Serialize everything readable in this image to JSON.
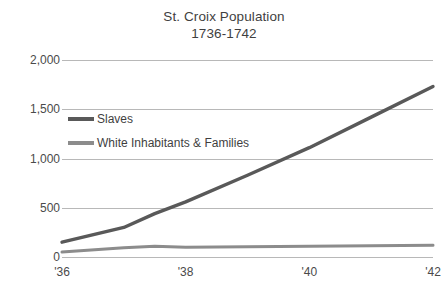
{
  "chart_data": {
    "type": "line",
    "title": "St. Croix Population",
    "subtitle": "1736-1742",
    "xlabel": "",
    "ylabel": "",
    "grid": true,
    "legend_position": "inline-plot",
    "x": [
      1736,
      1737,
      1737.5,
      1738,
      1739,
      1740,
      1741,
      1742
    ],
    "xtick_labels": [
      "'36",
      "'38",
      "'40",
      "'42"
    ],
    "xtick_values": [
      1736,
      1738,
      1740,
      1742
    ],
    "xlim": [
      1736,
      1742
    ],
    "ytick_labels": [
      "0",
      "500",
      "1,000",
      "1,500",
      "2,000"
    ],
    "ytick_values": [
      0,
      500,
      1000,
      1500,
      2000
    ],
    "ylim": [
      0,
      2000
    ],
    "series": [
      {
        "name": "Slaves",
        "color": "#595959",
        "values": [
          150,
          300,
          440,
          560,
          830,
          1110,
          1420,
          1730
        ]
      },
      {
        "name": "White Inhabitants & Families",
        "color": "#8c8c8c",
        "values": [
          50,
          95,
          110,
          100,
          105,
          110,
          115,
          120
        ]
      }
    ]
  },
  "title": {
    "line1": "St. Croix Population",
    "line2": "1736-1742"
  },
  "axes": {
    "y_ticks": [
      {
        "label": "2,000",
        "value": 2000
      },
      {
        "label": "1,500",
        "value": 1500
      },
      {
        "label": "1,000",
        "value": 1000
      },
      {
        "label": "500",
        "value": 500
      },
      {
        "label": "0",
        "value": 0
      }
    ],
    "x_ticks": [
      {
        "label": "'36",
        "value": 1736
      },
      {
        "label": "'38",
        "value": 1738
      },
      {
        "label": "'40",
        "value": 1740
      },
      {
        "label": "'42",
        "value": 1742
      }
    ]
  },
  "legend": {
    "entries": [
      {
        "label": "Slaves",
        "color": "#595959"
      },
      {
        "label": "White Inhabitants & Families",
        "color": "#8c8c8c"
      }
    ]
  }
}
